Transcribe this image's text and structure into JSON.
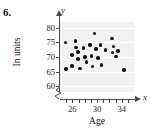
{
  "problem": {
    "number": "6."
  },
  "axis_letters": {
    "y": "y",
    "x": "x"
  },
  "chart_data": {
    "type": "scatter",
    "title": "",
    "xlabel": "Age",
    "ylabel": "In units",
    "xlim": [
      24,
      36
    ],
    "ylim": [
      58,
      82
    ],
    "grid": true,
    "legend": null,
    "x_ticks": [
      25,
      26,
      27,
      28,
      29,
      30,
      31,
      32,
      33,
      34,
      35
    ],
    "x_tick_labels": [
      "",
      "26",
      "",
      "",
      "",
      "30",
      "",
      "",
      "",
      "34",
      ""
    ],
    "y_ticks": [
      60,
      65,
      70,
      75,
      80
    ],
    "y_tick_labels": [
      "60",
      "65",
      "70",
      "75",
      "80"
    ],
    "axis_break": true,
    "points": [
      {
        "x": 24.9,
        "y": 75.0
      },
      {
        "x": 25.0,
        "y": 65.9
      },
      {
        "x": 25.9,
        "y": 70.6
      },
      {
        "x": 25.9,
        "y": 67.0
      },
      {
        "x": 26.5,
        "y": 75.4
      },
      {
        "x": 26.6,
        "y": 73.2
      },
      {
        "x": 26.9,
        "y": 71.8
      },
      {
        "x": 26.9,
        "y": 69.4
      },
      {
        "x": 27.2,
        "y": 66.1
      },
      {
        "x": 27.8,
        "y": 73.1
      },
      {
        "x": 28.1,
        "y": 70.0
      },
      {
        "x": 28.3,
        "y": 68.2
      },
      {
        "x": 28.9,
        "y": 74.2
      },
      {
        "x": 29.1,
        "y": 70.3
      },
      {
        "x": 29.3,
        "y": 66.8
      },
      {
        "x": 29.6,
        "y": 78.0
      },
      {
        "x": 29.8,
        "y": 72.7
      },
      {
        "x": 30.2,
        "y": 69.6
      },
      {
        "x": 30.6,
        "y": 74.2
      },
      {
        "x": 30.7,
        "y": 67.2
      },
      {
        "x": 31.4,
        "y": 72.3
      },
      {
        "x": 32.4,
        "y": 76.3
      },
      {
        "x": 32.5,
        "y": 71.6
      },
      {
        "x": 32.7,
        "y": 73.6
      },
      {
        "x": 33.1,
        "y": 70.2
      },
      {
        "x": 33.4,
        "y": 72.0
      },
      {
        "x": 34.4,
        "y": 65.6
      }
    ]
  }
}
